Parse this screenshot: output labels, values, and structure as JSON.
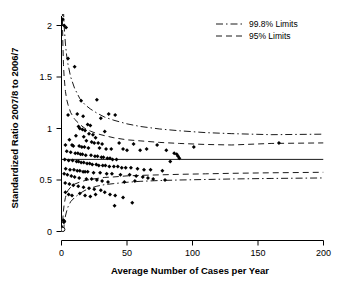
{
  "chart_data": {
    "type": "scatter",
    "title": "",
    "subtitle": "",
    "xlabel": "Average Number of Cases per Year",
    "ylabel": "Standardized Ratio 2007/8 to 2006/7",
    "xlim": [
      0,
      200
    ],
    "ylim": [
      0,
      2.15
    ],
    "xticks": [
      0,
      50,
      100,
      150,
      200
    ],
    "xtick_labels": [
      "0",
      "50",
      "100",
      "150",
      "200"
    ],
    "yticks": [
      0,
      0.5,
      1,
      1.5,
      2
    ],
    "ytick_labels": [
      "0",
      "0.5",
      "1",
      "1.5",
      "2"
    ],
    "grid": false,
    "legend_position": "top-right",
    "legend": [
      {
        "label": "99.8% Limits",
        "style": "dash-dot"
      },
      {
        "label": "95% Limits",
        "style": "dashed"
      }
    ],
    "center_line": {
      "label": "",
      "value": 0.7
    },
    "marker_color": "#000000",
    "line_color": "#000000",
    "series": [
      {
        "name": "Trusts",
        "marker": "filled-diamond",
        "points": [
          [
            1.0,
            2.06
          ],
          [
            2.0,
            2.0
          ],
          [
            3.5,
            1.98
          ],
          [
            5.0,
            1.68
          ],
          [
            10.0,
            1.6
          ],
          [
            15.0,
            1.27
          ],
          [
            27.0,
            1.28
          ],
          [
            5.0,
            1.13
          ],
          [
            12.0,
            1.14
          ],
          [
            16.5,
            1.12
          ],
          [
            30.0,
            1.1
          ],
          [
            36.0,
            1.14
          ],
          [
            41.0,
            1.13
          ],
          [
            20.0,
            1.04
          ],
          [
            22.0,
            1.03
          ],
          [
            13.0,
            1.02
          ],
          [
            14.0,
            1.0
          ],
          [
            16.0,
            0.99
          ],
          [
            18.0,
            0.98
          ],
          [
            33.0,
            0.97
          ],
          [
            21.0,
            0.95
          ],
          [
            24.0,
            0.94
          ],
          [
            11.0,
            0.93
          ],
          [
            17.0,
            0.92
          ],
          [
            26.0,
            0.91
          ],
          [
            6.0,
            0.89
          ],
          [
            19.0,
            0.88
          ],
          [
            23.0,
            0.87
          ],
          [
            25.0,
            0.86
          ],
          [
            28.0,
            0.86
          ],
          [
            31.0,
            0.85
          ],
          [
            3.0,
            0.84
          ],
          [
            8.0,
            0.84
          ],
          [
            9.0,
            0.83
          ],
          [
            13.5,
            0.83
          ],
          [
            15.5,
            0.82
          ],
          [
            17.5,
            0.82
          ],
          [
            20.5,
            0.81
          ],
          [
            29.0,
            0.81
          ],
          [
            34.0,
            0.8
          ],
          [
            38.0,
            0.8
          ],
          [
            44.0,
            0.86
          ],
          [
            47.0,
            0.8
          ],
          [
            50.0,
            0.79
          ],
          [
            55.0,
            0.85
          ],
          [
            60.0,
            0.79
          ],
          [
            65.0,
            0.8
          ],
          [
            73.0,
            0.84
          ],
          [
            80.0,
            0.79
          ],
          [
            86.0,
            0.76
          ],
          [
            88.0,
            0.75
          ],
          [
            89.0,
            0.73
          ],
          [
            90.0,
            0.71
          ],
          [
            101.0,
            0.82
          ],
          [
            166.0,
            0.86
          ],
          [
            4.0,
            0.78
          ],
          [
            7.0,
            0.77
          ],
          [
            10.5,
            0.76
          ],
          [
            12.5,
            0.76
          ],
          [
            14.5,
            0.75
          ],
          [
            16.0,
            0.75
          ],
          [
            18.5,
            0.74
          ],
          [
            22.5,
            0.74
          ],
          [
            25.5,
            0.73
          ],
          [
            27.5,
            0.73
          ],
          [
            30.5,
            0.72
          ],
          [
            32.0,
            0.72
          ],
          [
            35.0,
            0.71
          ],
          [
            37.0,
            0.71
          ],
          [
            39.0,
            0.7
          ],
          [
            42.0,
            0.7
          ],
          [
            2.5,
            0.7
          ],
          [
            5.5,
            0.69
          ],
          [
            8.5,
            0.69
          ],
          [
            11.5,
            0.68
          ],
          [
            13.0,
            0.68
          ],
          [
            15.0,
            0.67
          ],
          [
            17.0,
            0.67
          ],
          [
            19.5,
            0.66
          ],
          [
            21.5,
            0.66
          ],
          [
            23.5,
            0.65
          ],
          [
            26.5,
            0.65
          ],
          [
            28.5,
            0.64
          ],
          [
            31.5,
            0.64
          ],
          [
            33.5,
            0.64
          ],
          [
            36.5,
            0.63
          ],
          [
            40.0,
            0.63
          ],
          [
            43.0,
            0.63
          ],
          [
            46.0,
            0.62
          ],
          [
            49.0,
            0.62
          ],
          [
            53.0,
            0.62
          ],
          [
            58.0,
            0.61
          ],
          [
            63.0,
            0.6
          ],
          [
            68.0,
            0.6
          ],
          [
            77.0,
            0.59
          ],
          [
            83.0,
            0.68
          ],
          [
            3.2,
            0.61
          ],
          [
            6.5,
            0.6
          ],
          [
            9.5,
            0.6
          ],
          [
            12.0,
            0.59
          ],
          [
            14.0,
            0.59
          ],
          [
            16.5,
            0.58
          ],
          [
            18.0,
            0.58
          ],
          [
            20.0,
            0.58
          ],
          [
            24.5,
            0.57
          ],
          [
            29.5,
            0.57
          ],
          [
            34.5,
            0.56
          ],
          [
            38.5,
            0.56
          ],
          [
            45.0,
            0.55
          ],
          [
            52.0,
            0.55
          ],
          [
            57.0,
            0.54
          ],
          [
            62.0,
            0.53
          ],
          [
            66.0,
            0.52
          ],
          [
            70.0,
            0.51
          ],
          [
            79.0,
            0.5
          ],
          [
            2.0,
            0.56
          ],
          [
            4.5,
            0.55
          ],
          [
            7.5,
            0.54
          ],
          [
            10.0,
            0.53
          ],
          [
            13.5,
            0.52
          ],
          [
            19.0,
            0.51
          ],
          [
            23.0,
            0.51
          ],
          [
            27.0,
            0.5
          ],
          [
            31.0,
            0.49
          ],
          [
            35.5,
            0.48
          ],
          [
            48.0,
            0.48
          ],
          [
            56.0,
            0.49
          ],
          [
            2.8,
            0.47
          ],
          [
            6.0,
            0.46
          ],
          [
            9.0,
            0.45
          ],
          [
            12.8,
            0.44
          ],
          [
            16.8,
            0.43
          ],
          [
            21.0,
            0.42
          ],
          [
            25.0,
            0.41
          ],
          [
            30.0,
            0.4
          ],
          [
            3.0,
            0.38
          ],
          [
            5.5,
            0.36
          ],
          [
            8.0,
            0.35
          ],
          [
            14.0,
            0.37
          ],
          [
            18.0,
            0.35
          ],
          [
            22.0,
            0.34
          ],
          [
            26.0,
            0.36
          ],
          [
            33.0,
            0.38
          ],
          [
            37.0,
            0.36
          ],
          [
            41.0,
            0.35
          ],
          [
            47.0,
            0.33
          ],
          [
            54.0,
            0.28
          ],
          [
            40.5,
            0.25
          ],
          [
            1.5,
            0.11
          ],
          [
            2.2,
            0.1
          ],
          [
            1.8,
            0.09
          ]
        ]
      },
      {
        "name": "Trust (zero ratio)",
        "marker": "open-circle",
        "points": [
          [
            1.0,
            0.02
          ]
        ]
      }
    ],
    "limit_curves": {
      "upper_998": [
        [
          1.5,
          2.15
        ],
        [
          2,
          2.0
        ],
        [
          3,
          1.82
        ],
        [
          4,
          1.7
        ],
        [
          5,
          1.62
        ],
        [
          7,
          1.5
        ],
        [
          10,
          1.39
        ],
        [
          14,
          1.29
        ],
        [
          18,
          1.23
        ],
        [
          22,
          1.19
        ],
        [
          27,
          1.15
        ],
        [
          33,
          1.11
        ],
        [
          40,
          1.08
        ],
        [
          50,
          1.045
        ],
        [
          60,
          1.02
        ],
        [
          75,
          0.995
        ],
        [
          90,
          0.978
        ],
        [
          110,
          0.96
        ],
        [
          130,
          0.95
        ],
        [
          160,
          0.94
        ],
        [
          200,
          0.945
        ]
      ],
      "upper_95": [
        [
          0.6,
          2.15
        ],
        [
          1,
          1.85
        ],
        [
          1.5,
          1.62
        ],
        [
          2,
          1.5
        ],
        [
          3,
          1.36
        ],
        [
          4,
          1.28
        ],
        [
          5,
          1.23
        ],
        [
          7,
          1.155
        ],
        [
          10,
          1.09
        ],
        [
          14,
          1.04
        ],
        [
          18,
          1.0
        ],
        [
          22,
          0.975
        ],
        [
          27,
          0.95
        ],
        [
          33,
          0.93
        ],
        [
          40,
          0.91
        ],
        [
          50,
          0.89
        ],
        [
          60,
          0.88
        ],
        [
          75,
          0.865
        ],
        [
          90,
          0.855
        ],
        [
          110,
          0.845
        ],
        [
          130,
          0.84
        ],
        [
          160,
          0.855
        ],
        [
          200,
          0.86
        ]
      ],
      "lower_95": [
        [
          0.6,
          0.0
        ],
        [
          1,
          0.12
        ],
        [
          1.5,
          0.2
        ],
        [
          2,
          0.26
        ],
        [
          3,
          0.33
        ],
        [
          4,
          0.37
        ],
        [
          5,
          0.4
        ],
        [
          7,
          0.43
        ],
        [
          10,
          0.46
        ],
        [
          14,
          0.48
        ],
        [
          18,
          0.495
        ],
        [
          22,
          0.505
        ],
        [
          27,
          0.515
        ],
        [
          33,
          0.525
        ],
        [
          40,
          0.53
        ],
        [
          50,
          0.54
        ],
        [
          60,
          0.545
        ],
        [
          75,
          0.55
        ],
        [
          90,
          0.555
        ],
        [
          110,
          0.56
        ],
        [
          130,
          0.565
        ],
        [
          160,
          0.57
        ],
        [
          200,
          0.575
        ]
      ],
      "lower_998": [
        [
          1.5,
          0.0
        ],
        [
          2,
          0.06
        ],
        [
          3,
          0.15
        ],
        [
          4,
          0.2
        ],
        [
          5,
          0.24
        ],
        [
          7,
          0.29
        ],
        [
          10,
          0.33
        ],
        [
          14,
          0.37
        ],
        [
          18,
          0.4
        ],
        [
          22,
          0.42
        ],
        [
          27,
          0.44
        ],
        [
          33,
          0.455
        ],
        [
          40,
          0.465
        ],
        [
          50,
          0.478
        ],
        [
          60,
          0.487
        ],
        [
          75,
          0.495
        ],
        [
          90,
          0.5
        ],
        [
          110,
          0.505
        ],
        [
          130,
          0.51
        ],
        [
          160,
          0.515
        ],
        [
          200,
          0.52
        ]
      ]
    }
  },
  "axes": {
    "xlabel": "Average Number of Cases per Year",
    "ylabel": "Standardized Ratio 2007/8 to 2006/7"
  },
  "legend": {
    "items": [
      {
        "label": "99.8% Limits"
      },
      {
        "label": "95% Limits"
      }
    ]
  },
  "ticks": {
    "x": [
      "0",
      "50",
      "100",
      "150",
      "200"
    ],
    "y": [
      "0",
      "0.5",
      "1",
      "1.5",
      "2"
    ]
  }
}
